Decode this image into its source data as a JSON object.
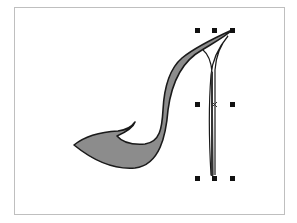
{
  "drawing": {
    "subject": "high-heel shoe outline",
    "fill_color": "#8c8c8c",
    "stroke_color": "#1a1a1a",
    "frame_color": "#bfbfbf",
    "selection": {
      "handle_color": "#111111",
      "handles": [
        {
          "x": 197,
          "y": 30
        },
        {
          "x": 214,
          "y": 30
        },
        {
          "x": 232,
          "y": 30
        },
        {
          "x": 197,
          "y": 104
        },
        {
          "x": 232,
          "y": 104
        },
        {
          "x": 197,
          "y": 178
        },
        {
          "x": 214,
          "y": 178
        },
        {
          "x": 232,
          "y": 178
        }
      ],
      "center_marker": {
        "x": 214,
        "y": 104
      }
    }
  }
}
